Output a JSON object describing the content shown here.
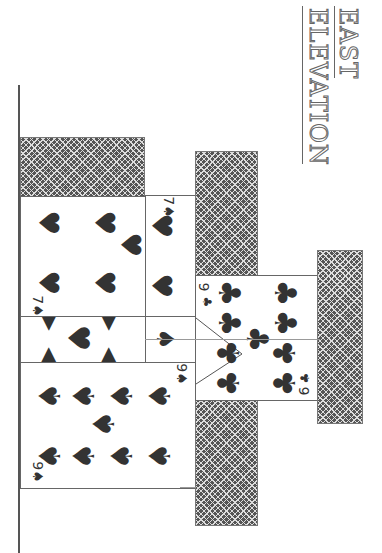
{
  "title": {
    "line1": "EAST",
    "line2": "ELEVATION"
  },
  "cards": {
    "seven_spades_main": {
      "rank": "7",
      "suit": "♠"
    },
    "seven_spades_side": {
      "rank": "7",
      "suit": "♠"
    },
    "nine_spades": {
      "rank": "9",
      "suit": "♠"
    },
    "nine_clubs": {
      "rank": "9",
      "suit": "♣"
    },
    "six_clubs": {
      "rank": "6",
      "suit": "♣"
    }
  },
  "colors": {
    "ink": "#333333",
    "line": "#555555",
    "background": "#ffffff"
  }
}
